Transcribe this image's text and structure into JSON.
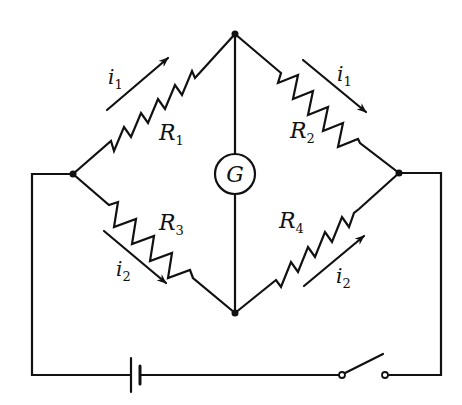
{
  "diagram": {
    "type": "Wheatstone bridge circuit",
    "colors": {
      "wire": "#111111",
      "background": "#ffffff"
    },
    "nodes": {
      "left": [
        73,
        174
      ],
      "top": [
        235,
        34
      ],
      "right": [
        399,
        173
      ],
      "bottom": [
        235,
        313
      ]
    },
    "resistors": [
      {
        "id": "R1",
        "label": "R",
        "subscript": "1",
        "branch": "left-top"
      },
      {
        "id": "R2",
        "label": "R",
        "subscript": "2",
        "branch": "top-right"
      },
      {
        "id": "R3",
        "label": "R",
        "subscript": "3",
        "branch": "left-bottom"
      },
      {
        "id": "R4",
        "label": "R",
        "subscript": "4",
        "branch": "bottom-right"
      }
    ],
    "currents": [
      {
        "label": "i",
        "subscript": "1",
        "branch": "R1",
        "direction": "toward top node"
      },
      {
        "label": "i",
        "subscript": "1",
        "branch": "R2",
        "direction": "toward right node"
      },
      {
        "label": "i",
        "subscript": "2",
        "branch": "R3",
        "direction": "toward bottom node"
      },
      {
        "label": "i",
        "subscript": "2",
        "branch": "R4",
        "direction": "toward right node"
      }
    ],
    "galvanometer": {
      "label": "G",
      "center": [
        235,
        174
      ],
      "radius": 20
    },
    "battery": {
      "label": "battery"
    },
    "switch": {
      "label": "switch",
      "state": "open"
    }
  }
}
